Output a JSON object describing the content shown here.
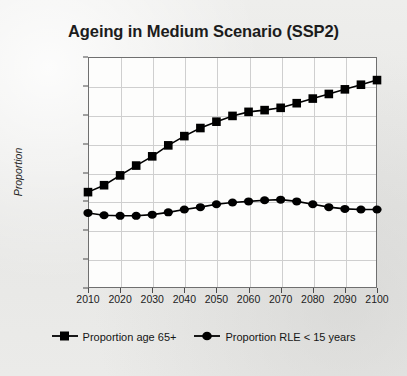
{
  "chart_data": {
    "type": "line",
    "title": "Ageing in Medium Scenario (SSP2)",
    "xlabel": "",
    "ylabel": "Proportion",
    "xlim": [
      2010,
      2100
    ],
    "ylim": [
      0.0,
      0.4
    ],
    "grid": true,
    "legend_position": "bottom",
    "x_tick_labels": [
      "2010",
      "2020",
      "2030",
      "2040",
      "2050",
      "2060",
      "2070",
      "2080",
      "2090",
      "2100"
    ],
    "x_ticks": [
      2010,
      2020,
      2030,
      2040,
      2050,
      2060,
      2070,
      2080,
      2090,
      2100
    ],
    "y_tick_labels": [
      "0.000",
      "0.050",
      "0.100",
      "0.150",
      "0.200",
      "0.250",
      "0.300",
      "0.350",
      "0.400"
    ],
    "y_ticks": [
      0.0,
      0.05,
      0.1,
      0.15,
      0.2,
      0.25,
      0.3,
      0.35,
      0.4
    ],
    "x": [
      2010,
      2015,
      2020,
      2025,
      2030,
      2035,
      2040,
      2045,
      2050,
      2055,
      2060,
      2065,
      2070,
      2075,
      2080,
      2085,
      2090,
      2095,
      2100
    ],
    "series": [
      {
        "name": "Proportion age 65+",
        "marker": "square",
        "color": "#000000",
        "values": [
          0.166,
          0.178,
          0.195,
          0.212,
          0.228,
          0.247,
          0.263,
          0.277,
          0.288,
          0.298,
          0.305,
          0.308,
          0.312,
          0.32,
          0.328,
          0.336,
          0.344,
          0.352,
          0.36
        ]
      },
      {
        "name": "Proportion RLE < 15 years",
        "marker": "circle",
        "color": "#000000",
        "values": [
          0.13,
          0.126,
          0.125,
          0.125,
          0.127,
          0.131,
          0.136,
          0.14,
          0.145,
          0.148,
          0.15,
          0.152,
          0.153,
          0.15,
          0.145,
          0.14,
          0.137,
          0.136,
          0.136
        ]
      }
    ]
  },
  "legend": {
    "entries": [
      {
        "label": "Proportion age 65+",
        "marker": "square-marker-icon"
      },
      {
        "label": "Proportion RLE < 15 years",
        "marker": "circle-marker-icon"
      }
    ]
  },
  "colors": {
    "series": "#000000",
    "grid": "#cfcfcf",
    "axis": "#6f6f6f",
    "plot_background": "#fdfdfc",
    "page_background": "#e9e9e7"
  }
}
